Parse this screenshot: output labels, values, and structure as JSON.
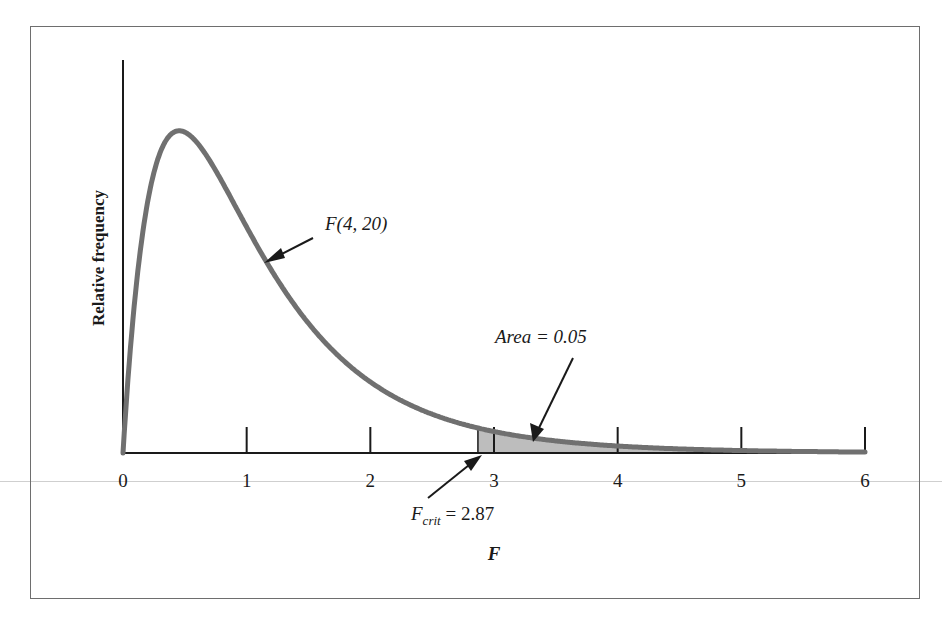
{
  "chart_data": {
    "type": "line",
    "title": "",
    "distribution": "F(4, 20)",
    "xlabel": "F",
    "ylabel": "Relative frequency",
    "xlim": [
      0,
      6
    ],
    "x_ticks": [
      0,
      1,
      2,
      3,
      4,
      5,
      6
    ],
    "x_tick_labels": [
      "0",
      "1",
      "2",
      "3",
      "4",
      "5",
      "6"
    ],
    "y_ticks": [],
    "grid": false,
    "legend": null,
    "series": [
      {
        "name": "F(4, 20)",
        "color": "#6f6f6f",
        "x": [
          0,
          0.05,
          0.1,
          0.2,
          0.3,
          0.4,
          0.5,
          0.6,
          0.8,
          1.0,
          1.2,
          1.5,
          2.0,
          2.5,
          2.87,
          3.0,
          3.5,
          4.0,
          5.0,
          6.0
        ],
        "y": [
          0,
          0.21,
          0.37,
          0.56,
          0.66,
          0.7,
          0.71,
          0.69,
          0.61,
          0.52,
          0.43,
          0.31,
          0.17,
          0.09,
          0.05,
          0.045,
          0.027,
          0.017,
          0.007,
          0.003
        ]
      }
    ],
    "shaded_region": {
      "from": 2.87,
      "to": 6,
      "color": "#bdbdbd",
      "label": "Area = 0.05",
      "area": 0.05
    },
    "annotations": [
      {
        "text": "F(4, 20)",
        "points_to": "curve near F=1.15"
      },
      {
        "text": "Area = 0.05",
        "points_to": "shaded right tail"
      },
      {
        "text": "F_crit = 2.87",
        "points_to": "x = 2.87",
        "value": 2.87
      }
    ]
  },
  "labels": {
    "ylabel": "Relative frequency",
    "xlabel": "F",
    "curve_label": "F(4, 20)",
    "area_label": "Area = 0.05",
    "crit_main": "F",
    "crit_sub": "crit",
    "crit_value": " = 2.87",
    "ticks": [
      "0",
      "1",
      "2",
      "3",
      "4",
      "5",
      "6"
    ]
  }
}
